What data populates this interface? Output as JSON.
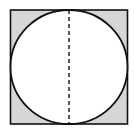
{
  "diagram": {
    "colors": {
      "background": "#ffffff",
      "shade": "#d6d6d6",
      "stroke": "#111111",
      "circle_fill": "#ffffff"
    },
    "square": {
      "x": 10.5,
      "y": 10.5,
      "size": 116
    },
    "circle": {
      "cx": 68.5,
      "cy": 67.5,
      "r": 57.5
    },
    "diameter": {
      "style": "dashed",
      "orientation": "vertical"
    }
  }
}
